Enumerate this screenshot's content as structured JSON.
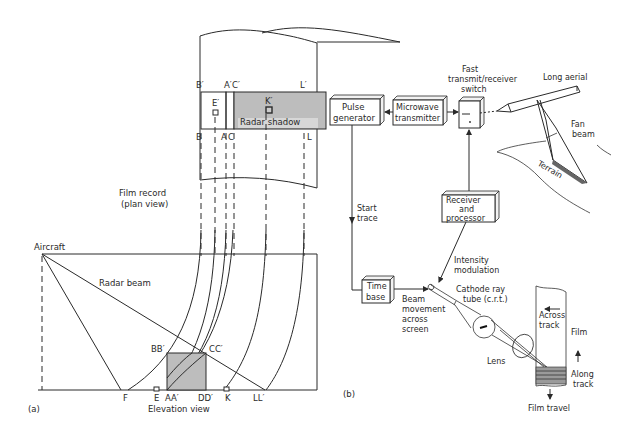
{
  "figure": {
    "panel_a": {
      "label": "(a)",
      "film_record": {
        "caption_line1": "Film record",
        "caption_line2": "(plan view)",
        "top_labels": [
          "B′",
          "A′",
          "C′",
          "L′"
        ],
        "bottom_labels": [
          "B",
          "A",
          "C",
          "L"
        ],
        "point_labels": [
          "E′",
          "K′"
        ],
        "shadow_label": "Radar shadow"
      },
      "elevation": {
        "aircraft_label": "Aircraft",
        "beam_label": "Radar beam",
        "corner_labels": [
          "BB′",
          "CC′"
        ],
        "ground_labels": [
          "F",
          "E",
          "AA′",
          "DD′",
          "K",
          "LL′"
        ],
        "caption": "Elevation view"
      }
    },
    "panel_b": {
      "label": "(b)",
      "blocks": {
        "pulse_generator": [
          "Pulse",
          "generator"
        ],
        "microwave_transmitter": [
          "Microwave",
          "transmitter"
        ],
        "switch_caption": [
          "Fast",
          "transmit/receiver",
          "switch"
        ],
        "receiver": [
          "Receiver",
          "and",
          "processor"
        ],
        "time_base": [
          "Time",
          "base"
        ]
      },
      "labels": {
        "long_aerial": "Long aerial",
        "fan_beam": [
          "Fan",
          "beam"
        ],
        "terrain": "Terrain",
        "start_trace": [
          "Start",
          "trace"
        ],
        "intensity_modulation": [
          "Intensity",
          "modulation"
        ],
        "crt": [
          "Cathode ray",
          "tube (c.r.t.)"
        ],
        "beam_movement": [
          "Beam",
          "movement",
          "across",
          "screen"
        ],
        "lens": "Lens",
        "across_track": [
          "Across",
          "track"
        ],
        "film": "Film",
        "along_track": [
          "Along",
          "track"
        ],
        "film_travel": "Film travel"
      }
    }
  }
}
